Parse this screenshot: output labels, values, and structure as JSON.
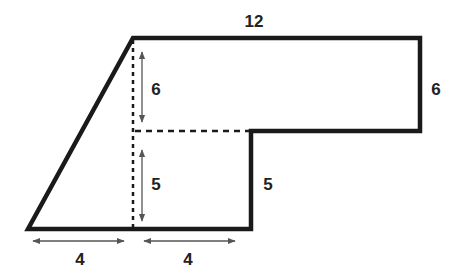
{
  "diagram": {
    "labels": {
      "top": "12",
      "right_upper": "6",
      "inner_upper_height": "6",
      "inner_lower_height": "5",
      "right_lower": "5",
      "bottom_left": "4",
      "bottom_right": "4"
    },
    "colors": {
      "outline": "#1a1a1a",
      "dashed": "#1a1a1a",
      "arrows": "#555555",
      "text": "#222222"
    }
  }
}
